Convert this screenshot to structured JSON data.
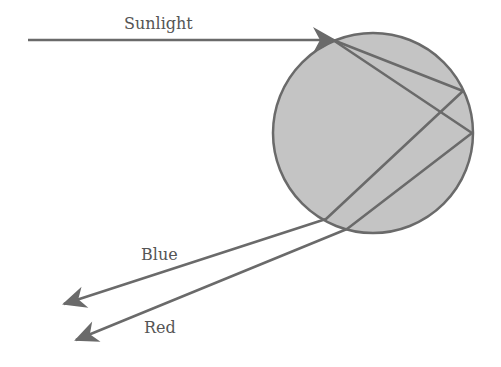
{
  "diagram": {
    "labels": {
      "sunlight": "Sunlight",
      "blue": "Blue",
      "red": "Red"
    },
    "colors": {
      "drop_fill": "#c4c4c4",
      "stroke": "#6a6a6a",
      "text": "#555555"
    },
    "drop": {
      "cx": 373,
      "cy": 133,
      "r": 100
    },
    "rays": {
      "incoming": {
        "x1": 28,
        "y1": 40,
        "x2": 333,
        "y2": 40
      },
      "blue_path": [
        [
          333,
          40
        ],
        [
          463,
          91
        ],
        [
          326,
          219
        ],
        [
          64,
          304
        ]
      ],
      "red_path": [
        [
          333,
          40
        ],
        [
          472,
          133
        ],
        [
          347,
          229
        ],
        [
          76,
          340
        ]
      ]
    }
  }
}
